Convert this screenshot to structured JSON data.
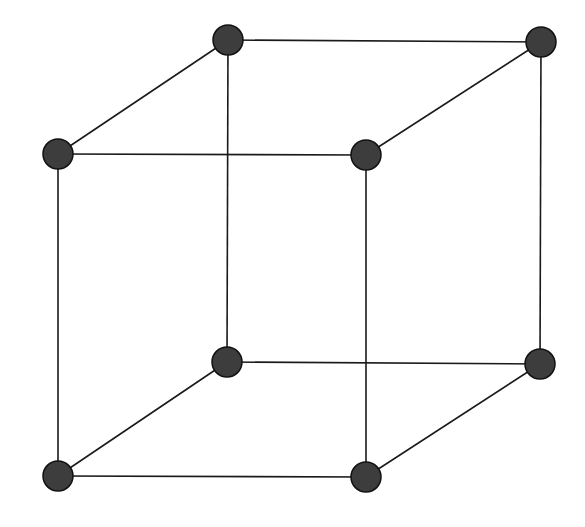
{
  "diagram": {
    "type": "cube-wireframe",
    "background": "#ffffff",
    "edge_color": "#1a1a1a",
    "edge_width": 1.6,
    "node_fill": "#3d3d3d",
    "node_stroke": "#111111",
    "node_radius": 15,
    "nodes": [
      {
        "id": "back-top-left",
        "x": 228,
        "y": 40
      },
      {
        "id": "back-top-right",
        "x": 541,
        "y": 42
      },
      {
        "id": "front-top-left",
        "x": 58,
        "y": 154
      },
      {
        "id": "front-top-right",
        "x": 366,
        "y": 155
      },
      {
        "id": "back-bottom-left",
        "x": 227,
        "y": 362
      },
      {
        "id": "back-bottom-right",
        "x": 540,
        "y": 364
      },
      {
        "id": "front-bottom-left",
        "x": 58,
        "y": 476
      },
      {
        "id": "front-bottom-right",
        "x": 366,
        "y": 477
      }
    ],
    "edges": [
      [
        "back-top-left",
        "back-top-right"
      ],
      [
        "front-top-left",
        "front-top-right"
      ],
      [
        "back-top-left",
        "front-top-left"
      ],
      [
        "back-top-right",
        "front-top-right"
      ],
      [
        "back-bottom-left",
        "back-bottom-right"
      ],
      [
        "front-bottom-left",
        "front-bottom-right"
      ],
      [
        "back-bottom-left",
        "front-bottom-left"
      ],
      [
        "back-bottom-right",
        "front-bottom-right"
      ],
      [
        "back-top-left",
        "back-bottom-left"
      ],
      [
        "back-top-right",
        "back-bottom-right"
      ],
      [
        "front-top-left",
        "front-bottom-left"
      ],
      [
        "front-top-right",
        "front-bottom-right"
      ]
    ]
  }
}
